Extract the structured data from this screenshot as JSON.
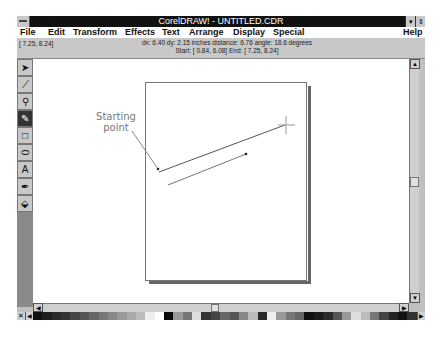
{
  "window": {
    "title": "CorelDRAW! - UNTITLED.CDR",
    "minimize_glyph": "▾",
    "restore_glyph": "⇕"
  },
  "menu": {
    "items": [
      {
        "label": "File",
        "x": 3
      },
      {
        "label": "Edit",
        "x": 31
      },
      {
        "label": "Transform",
        "x": 56
      },
      {
        "label": "Effects",
        "x": 108
      },
      {
        "label": "Text",
        "x": 145
      },
      {
        "label": "Arrange",
        "x": 172
      },
      {
        "label": "Display",
        "x": 216
      },
      {
        "label": "Special",
        "x": 256
      }
    ],
    "help": "Help"
  },
  "status": {
    "cursor_pos": "[ 7.25,  8.24]",
    "line1": "dx: 6.40  dy: 2.15 inches  distance: 6.76  angle: 18.6 degrees",
    "line2": "Start: [ 0.84,  6.08]  End: [ 7.25,  8.24]"
  },
  "toolbox": {
    "tools": [
      {
        "name": "pick-tool",
        "glyph": "➤"
      },
      {
        "name": "shape-tool",
        "glyph": "⟋"
      },
      {
        "name": "zoom-tool",
        "glyph": "⚲"
      },
      {
        "name": "pencil-tool",
        "glyph": "✎",
        "active": true
      },
      {
        "name": "rectangle-tool",
        "glyph": "□"
      },
      {
        "name": "ellipse-tool",
        "glyph": "⬭"
      },
      {
        "name": "text-tool",
        "glyph": "A"
      },
      {
        "name": "outline-tool",
        "glyph": "✒"
      },
      {
        "name": "fill-tool",
        "glyph": "⬙"
      }
    ]
  },
  "canvas": {
    "annotation": "Starting point",
    "annotation_line1": "Starting",
    "annotation_line2": "point"
  },
  "scrollbars": {
    "up_glyph": "▲",
    "down_glyph": "▼",
    "left_glyph": "◀",
    "right_glyph": "▶"
  },
  "palette": {
    "no_fill_glyph": "✕",
    "arrow_glyph": "◀",
    "right_arrow_glyph": "▶",
    "colors": [
      "#111111",
      "#1e1e1e",
      "#2a2a2a",
      "#333333",
      "#444444",
      "#555555",
      "#666666",
      "#777777",
      "#888888",
      "#999999",
      "#aaaaaa",
      "#bbbbbb",
      "#eeeeee",
      "#ffffff",
      "#0a0a0a",
      "#9a9a9a",
      "#777777",
      "#dddddd",
      "#333333",
      "#444444",
      "#666666",
      "#555555",
      "#888888",
      "#bbbbbb",
      "#2a2a2a",
      "#efefef",
      "#999999",
      "#777777",
      "#666666",
      "#111111",
      "#1a1a1a",
      "#2a2a2a",
      "#555555",
      "#999999",
      "#dddddd",
      "#bbbbbb",
      "#777777",
      "#444444",
      "#222222",
      "#111111",
      "#333333"
    ]
  }
}
